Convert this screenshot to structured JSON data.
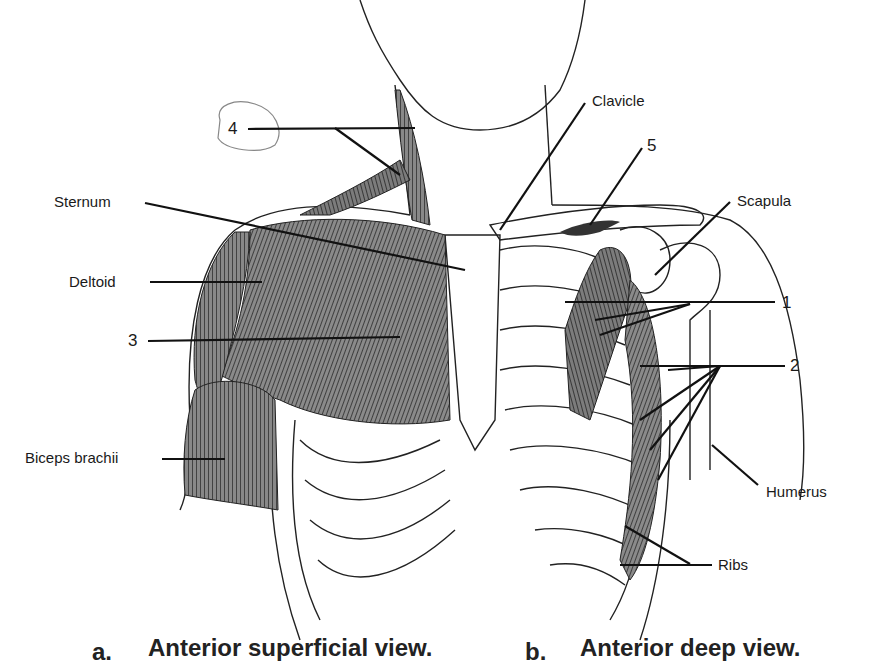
{
  "labels": {
    "sternum": "Sternum",
    "deltoid": "Deltoid",
    "biceps": "Biceps brachii",
    "clavicle": "Clavicle",
    "scapula": "Scapula",
    "humerus": "Humerus",
    "ribs": "Ribs",
    "n1": "1",
    "n2": "2",
    "n3": "3",
    "n4": "4",
    "n5": "5"
  },
  "captions": {
    "a_letter": "a.",
    "a_text": "Anterior superficial view.",
    "b_letter": "b.",
    "b_text": "Anterior deep view."
  }
}
